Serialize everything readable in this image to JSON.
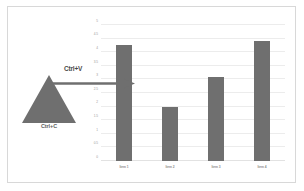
{
  "figure": {
    "background_color": "#ffffff",
    "border_color": "#d8d8d8"
  },
  "annotations": {
    "copy": {
      "label": "Ctrl+C",
      "icon": "triangle-shape",
      "color": "#6f6f6f"
    },
    "paste": {
      "label": "Ctrl+V",
      "icon": "arrow-right-icon",
      "color": "#6f6f6f"
    }
  },
  "chart_data": {
    "type": "bar",
    "title": "",
    "xlabel": "",
    "ylabel": "",
    "categories": [
      "Item 1",
      "Item 2",
      "Item 3",
      "Item 4"
    ],
    "values": [
      4.25,
      2.0,
      3.1,
      4.4
    ],
    "ylim": [
      0,
      5
    ],
    "yticks": [
      0,
      0.5,
      1,
      1.5,
      2,
      2.5,
      3,
      3.5,
      4,
      4.5,
      5
    ],
    "ytick_labels": [
      "0",
      "0.5",
      "1",
      "1.5",
      "2",
      "2.5",
      "3",
      "3.5",
      "4",
      "4.5",
      "5"
    ],
    "grid": true,
    "legend": "none",
    "bar_color": "#6f6f6f",
    "gridline_color": "#ececec"
  }
}
